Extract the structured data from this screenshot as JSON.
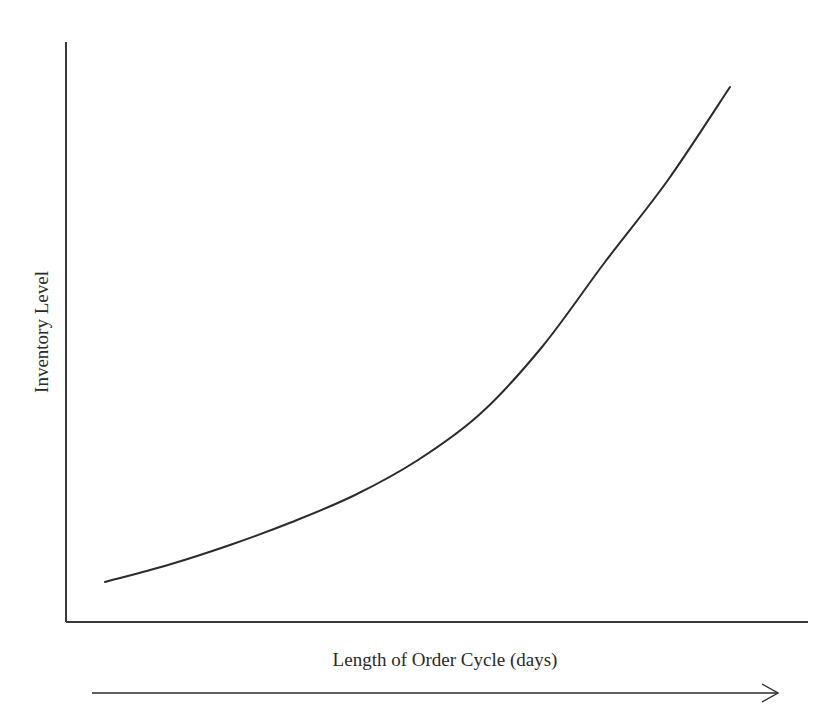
{
  "chart_data": {
    "type": "line",
    "title": "",
    "xlabel": "Length of Order Cycle (days)",
    "ylabel": "Inventory Level",
    "x_ticks": [],
    "y_ticks": [],
    "grid": false,
    "legend": null,
    "x_direction_arrow": true,
    "series": [
      {
        "name": "Inventory Level vs. Order Cycle Length",
        "description": "Convex, exponentially increasing curve (qualitative, unitless)",
        "x": [
          0.0,
          0.1,
          0.2,
          0.3,
          0.4,
          0.5,
          0.6,
          0.7,
          0.8,
          0.9,
          1.0
        ],
        "values": [
          0.07,
          0.12,
          0.17,
          0.24,
          0.31,
          0.4,
          0.51,
          0.64,
          0.78,
          0.89,
          1.0
        ],
        "pixel_points": [
          [
            105,
            582
          ],
          [
            168,
            565
          ],
          [
            230,
            545
          ],
          [
            292,
            522
          ],
          [
            355,
            495
          ],
          [
            418,
            460
          ],
          [
            480,
            414
          ],
          [
            542,
            347
          ],
          [
            605,
            262
          ],
          [
            668,
            180
          ],
          [
            730,
            87
          ]
        ]
      }
    ],
    "axes": {
      "origin_px": [
        66,
        622
      ],
      "x_end_px": 808,
      "y_top_px": 42
    },
    "arrow": {
      "x1_px": 92,
      "x2_px": 778,
      "y_px": 693
    },
    "colors": {
      "line": "#2b2b2b",
      "axis": "#3a3a3a",
      "background": "#ffffff"
    }
  }
}
